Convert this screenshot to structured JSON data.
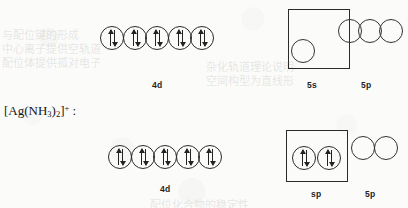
{
  "figure": {
    "species_label": {
      "prefix": "[Ag(NH",
      "sub1": "3",
      "mid": ")",
      "sub2": "2",
      "suffix": "]",
      "charge": "+",
      "colon": " :"
    }
  },
  "bleed_text": [
    {
      "text": "与配位键的形成",
      "x": 2,
      "y": 26
    },
    {
      "text": "中心离子提供空轨道",
      "x": 2,
      "y": 40
    },
    {
      "text": "配位体提供孤对电子",
      "x": 2,
      "y": 54
    },
    {
      "text": "杂化轨道理论说明",
      "x": 206,
      "y": 58
    },
    {
      "text": "空间构型为直线形",
      "x": 206,
      "y": 72
    },
    {
      "text": "配位化合物的稳定性",
      "x": 150,
      "y": 196
    }
  ],
  "rows": [
    {
      "name": "ag-ion-configuration",
      "d_orbitals": {
        "label": "4d",
        "count": 5,
        "occupancy": [
          "paired",
          "paired",
          "paired",
          "paired",
          "paired"
        ]
      },
      "s_orbital": {
        "label": "5s",
        "boxed": true,
        "count": 1,
        "occupancy": [
          "empty"
        ]
      },
      "p_orbitals": {
        "label": "5p",
        "count": 3,
        "occupancy": [
          "empty",
          "empty",
          "empty"
        ]
      }
    },
    {
      "name": "complex-ion-configuration",
      "d_orbitals": {
        "label": "4d",
        "count": 5,
        "occupancy": [
          "paired",
          "paired",
          "paired",
          "paired",
          "paired"
        ]
      },
      "hybrid_orbitals": {
        "label": "sp",
        "boxed": true,
        "count": 2,
        "occupancy": [
          "paired",
          "paired"
        ]
      },
      "p_orbitals": {
        "label": "5p",
        "count": 2,
        "occupancy": [
          "empty",
          "empty"
        ]
      }
    }
  ]
}
